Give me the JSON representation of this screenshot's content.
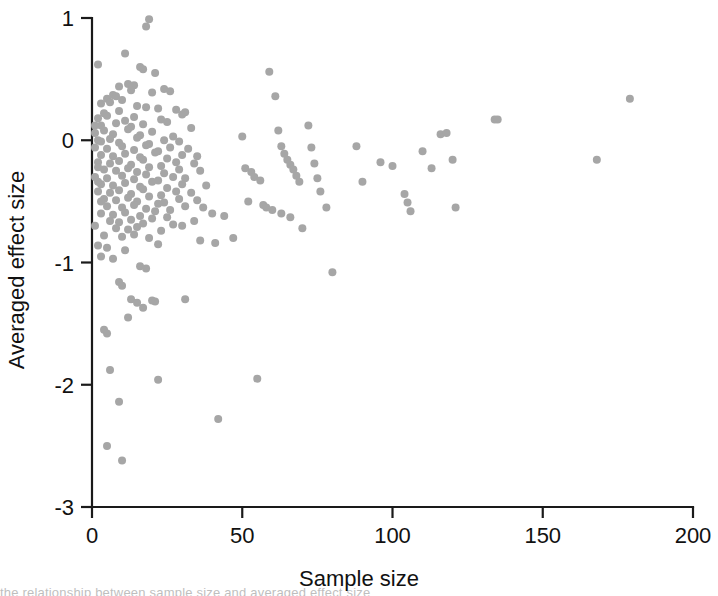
{
  "figure": {
    "background_color": "#ffffff",
    "point_color": "#a6a6a6",
    "axis_color": "#1a1a1a",
    "partial_caption": "the relationship between sample size and averaged effect size"
  },
  "chart_data": {
    "type": "scatter",
    "title": "",
    "xlabel": "Sample size",
    "ylabel": "Averaged effect size",
    "xlim": [
      0,
      200
    ],
    "ylim": [
      -3,
      1
    ],
    "xticks": [
      0,
      50,
      100,
      150,
      200
    ],
    "yticks": [
      1,
      0,
      -1,
      -2,
      -3
    ],
    "xtick_labels": [
      "0",
      "50",
      "100",
      "150",
      "200"
    ],
    "ytick_labels": [
      "1",
      "0",
      "-1",
      "-2",
      "-3"
    ],
    "grid": false,
    "legend": false,
    "marker": "circle",
    "marker_color": "#a6a6a6",
    "marker_size": 8,
    "n_points": 218,
    "points": [
      [
        19,
        0.99
      ],
      [
        18,
        0.93
      ],
      [
        2,
        0.62
      ],
      [
        11,
        0.71
      ],
      [
        16,
        0.6
      ],
      [
        17,
        0.58
      ],
      [
        21,
        0.55
      ],
      [
        9,
        0.44
      ],
      [
        12,
        0.46
      ],
      [
        14,
        0.45
      ],
      [
        5,
        0.34
      ],
      [
        7,
        0.37
      ],
      [
        8,
        0.36
      ],
      [
        13,
        0.41
      ],
      [
        20,
        0.39
      ],
      [
        24,
        0.42
      ],
      [
        26,
        0.4
      ],
      [
        3,
        0.3
      ],
      [
        6,
        0.31
      ],
      [
        10,
        0.33
      ],
      [
        15,
        0.28
      ],
      [
        22,
        0.26
      ],
      [
        4,
        0.22
      ],
      [
        9,
        0.24
      ],
      [
        18,
        0.27
      ],
      [
        28,
        0.25
      ],
      [
        31,
        0.23
      ],
      [
        2,
        0.18
      ],
      [
        5,
        0.2
      ],
      [
        11,
        0.16
      ],
      [
        14,
        0.19
      ],
      [
        23,
        0.17
      ],
      [
        30,
        0.21
      ],
      [
        3,
        0.12
      ],
      [
        8,
        0.14
      ],
      [
        13,
        0.11
      ],
      [
        17,
        0.13
      ],
      [
        25,
        0.15
      ],
      [
        33,
        0.1
      ],
      [
        1,
        0.06
      ],
      [
        4,
        0.08
      ],
      [
        7,
        0.05
      ],
      [
        12,
        0.09
      ],
      [
        16,
        0.04
      ],
      [
        20,
        0.07
      ],
      [
        27,
        0.03
      ],
      [
        2,
        0.0
      ],
      [
        3,
        -0.01
      ],
      [
        6,
        0.01
      ],
      [
        9,
        -0.02
      ],
      [
        15,
        0.02
      ],
      [
        19,
        -0.03
      ],
      [
        24,
        0.0
      ],
      [
        29,
        -0.01
      ],
      [
        1,
        -0.06
      ],
      [
        5,
        -0.07
      ],
      [
        10,
        -0.05
      ],
      [
        14,
        -0.08
      ],
      [
        18,
        -0.04
      ],
      [
        22,
        -0.09
      ],
      [
        26,
        -0.06
      ],
      [
        32,
        -0.07
      ],
      [
        3,
        -0.12
      ],
      [
        7,
        -0.13
      ],
      [
        11,
        -0.11
      ],
      [
        16,
        -0.14
      ],
      [
        21,
        -0.1
      ],
      [
        25,
        -0.15
      ],
      [
        30,
        -0.12
      ],
      [
        35,
        -0.13
      ],
      [
        2,
        -0.18
      ],
      [
        6,
        -0.19
      ],
      [
        9,
        -0.17
      ],
      [
        13,
        -0.2
      ],
      [
        17,
        -0.16
      ],
      [
        23,
        -0.21
      ],
      [
        28,
        -0.18
      ],
      [
        34,
        -0.19
      ],
      [
        4,
        -0.24
      ],
      [
        8,
        -0.25
      ],
      [
        12,
        -0.23
      ],
      [
        15,
        -0.26
      ],
      [
        19,
        -0.22
      ],
      [
        24,
        -0.27
      ],
      [
        29,
        -0.24
      ],
      [
        36,
        -0.25
      ],
      [
        1,
        -0.3
      ],
      [
        5,
        -0.31
      ],
      [
        10,
        -0.29
      ],
      [
        14,
        -0.32
      ],
      [
        18,
        -0.28
      ],
      [
        22,
        -0.33
      ],
      [
        27,
        -0.3
      ],
      [
        31,
        -0.31
      ],
      [
        3,
        -0.36
      ],
      [
        7,
        -0.37
      ],
      [
        11,
        -0.35
      ],
      [
        16,
        -0.38
      ],
      [
        20,
        -0.34
      ],
      [
        25,
        -0.39
      ],
      [
        30,
        -0.36
      ],
      [
        38,
        -0.37
      ],
      [
        2,
        -0.42
      ],
      [
        6,
        -0.43
      ],
      [
        9,
        -0.41
      ],
      [
        13,
        -0.44
      ],
      [
        17,
        -0.4
      ],
      [
        23,
        -0.45
      ],
      [
        28,
        -0.42
      ],
      [
        33,
        -0.43
      ],
      [
        4,
        -0.48
      ],
      [
        8,
        -0.49
      ],
      [
        12,
        -0.47
      ],
      [
        15,
        -0.5
      ],
      [
        19,
        -0.46
      ],
      [
        24,
        -0.51
      ],
      [
        29,
        -0.48
      ],
      [
        35,
        -0.49
      ],
      [
        5,
        -0.54
      ],
      [
        10,
        -0.55
      ],
      [
        14,
        -0.53
      ],
      [
        18,
        -0.56
      ],
      [
        22,
        -0.52
      ],
      [
        26,
        -0.57
      ],
      [
        31,
        -0.54
      ],
      [
        37,
        -0.55
      ],
      [
        3,
        -0.6
      ],
      [
        7,
        -0.61
      ],
      [
        11,
        -0.59
      ],
      [
        16,
        -0.62
      ],
      [
        21,
        -0.58
      ],
      [
        25,
        -0.63
      ],
      [
        40,
        -0.6
      ],
      [
        44,
        -0.62
      ],
      [
        6,
        -0.66
      ],
      [
        9,
        -0.67
      ],
      [
        13,
        -0.65
      ],
      [
        17,
        -0.68
      ],
      [
        20,
        -0.64
      ],
      [
        27,
        -0.69
      ],
      [
        34,
        -0.66
      ],
      [
        8,
        -0.72
      ],
      [
        12,
        -0.73
      ],
      [
        15,
        -0.71
      ],
      [
        23,
        -0.74
      ],
      [
        30,
        -0.7
      ],
      [
        4,
        -0.78
      ],
      [
        10,
        -0.79
      ],
      [
        14,
        -0.77
      ],
      [
        19,
        -0.8
      ],
      [
        36,
        -0.82
      ],
      [
        2,
        -0.86
      ],
      [
        5,
        -0.88
      ],
      [
        11,
        -0.9
      ],
      [
        22,
        -0.85
      ],
      [
        41,
        -0.84
      ],
      [
        3,
        -0.95
      ],
      [
        7,
        -0.97
      ],
      [
        16,
        -1.03
      ],
      [
        18,
        -1.05
      ],
      [
        9,
        -1.16
      ],
      [
        10,
        -1.19
      ],
      [
        13,
        -1.3
      ],
      [
        15,
        -1.33
      ],
      [
        20,
        -1.31
      ],
      [
        21,
        -1.32
      ],
      [
        31,
        -1.3
      ],
      [
        17,
        -1.37
      ],
      [
        12,
        -1.45
      ],
      [
        4,
        -1.55
      ],
      [
        5,
        -1.58
      ],
      [
        6,
        -1.88
      ],
      [
        9,
        -2.14
      ],
      [
        22,
        -1.96
      ],
      [
        55,
        -1.95
      ],
      [
        5,
        -2.5
      ],
      [
        10,
        -2.62
      ],
      [
        42,
        -2.28
      ],
      [
        47,
        -0.8
      ],
      [
        50,
        0.03
      ],
      [
        51,
        -0.23
      ],
      [
        53,
        -0.26
      ],
      [
        54,
        -0.3
      ],
      [
        56,
        -0.33
      ],
      [
        52,
        -0.5
      ],
      [
        57,
        -0.53
      ],
      [
        58,
        -0.55
      ],
      [
        59,
        0.56
      ],
      [
        61,
        0.36
      ],
      [
        62,
        0.08
      ],
      [
        63,
        -0.05
      ],
      [
        64,
        -0.11
      ],
      [
        65,
        -0.16
      ],
      [
        66,
        -0.2
      ],
      [
        67,
        -0.24
      ],
      [
        68,
        -0.29
      ],
      [
        69,
        -0.34
      ],
      [
        60,
        -0.57
      ],
      [
        63,
        -0.6
      ],
      [
        66,
        -0.63
      ],
      [
        70,
        -0.72
      ],
      [
        72,
        0.12
      ],
      [
        73,
        -0.06
      ],
      [
        74,
        -0.19
      ],
      [
        75,
        -0.31
      ],
      [
        76,
        -0.42
      ],
      [
        78,
        -0.55
      ],
      [
        80,
        -1.08
      ],
      [
        88,
        -0.05
      ],
      [
        90,
        -0.34
      ],
      [
        96,
        -0.18
      ],
      [
        100,
        -0.21
      ],
      [
        104,
        -0.44
      ],
      [
        106,
        -0.58
      ],
      [
        105,
        -0.51
      ],
      [
        110,
        -0.09
      ],
      [
        113,
        -0.23
      ],
      [
        116,
        0.05
      ],
      [
        118,
        0.06
      ],
      [
        120,
        -0.16
      ],
      [
        121,
        -0.55
      ],
      [
        134,
        0.17
      ],
      [
        135,
        0.17
      ],
      [
        168,
        -0.16
      ],
      [
        179,
        0.34
      ],
      [
        1,
        -0.7
      ],
      [
        2,
        -0.34
      ],
      [
        3,
        -0.5
      ],
      [
        1,
        0.12
      ],
      [
        2,
        -0.22
      ]
    ]
  }
}
